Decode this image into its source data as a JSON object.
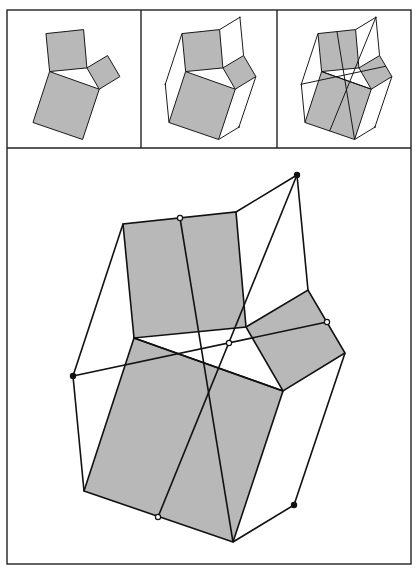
{
  "figure": {
    "colors": {
      "square_fill": "#b8b8b8",
      "stroke": "#111111",
      "background": "#ffffff"
    },
    "frame": {
      "outer": {
        "x": 7,
        "y": 10,
        "w": 404,
        "h": 554
      },
      "top_row_bottom": 148,
      "dividers_x": [
        141,
        277
      ]
    },
    "shape": {
      "triangle": {
        "A": [
          134,
          338
        ],
        "B": [
          246,
          327
        ],
        "C": [
          283,
          391
        ]
      },
      "square_on_AB": [
        [
          134,
          338
        ],
        [
          123,
          224
        ],
        [
          236,
          212
        ],
        [
          246,
          327
        ]
      ],
      "square_on_BC": [
        [
          246,
          327
        ],
        [
          308,
          290
        ],
        [
          345,
          353
        ],
        [
          283,
          391
        ]
      ],
      "square_on_AC": [
        [
          134,
          338
        ],
        [
          283,
          391
        ],
        [
          233,
          542
        ],
        [
          84,
          491
        ]
      ],
      "hexagon_points": {
        "top_dot": [
          297,
          175
        ],
        "left_dot": [
          73,
          376
        ],
        "bottom_right_dot": [
          294,
          505
        ]
      },
      "open_points": {
        "top_mid": [
          180,
          218
        ],
        "right_mid": [
          327,
          322
        ],
        "bottom_mid": [
          158,
          517
        ],
        "center": [
          229,
          343
        ]
      }
    },
    "panels": [
      {
        "id": "panel-1",
        "label": "squares on triangle sides",
        "scale": 0.333,
        "dx": 5,
        "dy": -41,
        "show_hexagon": false,
        "show_diagonals": false,
        "show_markers": false
      },
      {
        "id": "panel-2",
        "label": "hexagon connections added",
        "scale": 0.333,
        "dx": 141,
        "dy": -41,
        "show_hexagon": true,
        "show_diagonals": false,
        "show_markers": true
      },
      {
        "id": "panel-3",
        "label": "dissection lines added",
        "scale": 0.333,
        "dx": 277,
        "dy": -41,
        "show_hexagon": true,
        "show_diagonals": true,
        "show_markers": true
      },
      {
        "id": "panel-main",
        "label": "enlarged dissection",
        "scale": 1,
        "dx": 0,
        "dy": 0,
        "show_hexagon": true,
        "show_diagonals": true,
        "show_markers": true
      }
    ]
  }
}
